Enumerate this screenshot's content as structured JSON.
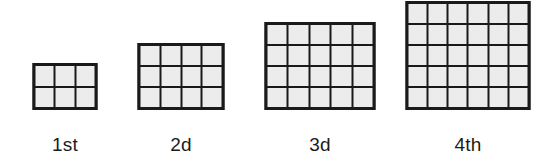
{
  "page": {
    "background_color": "#ffffff",
    "cell_fill_color": "#ececec",
    "line_color": "#1a1a1a",
    "label_color": "#1b1b1b"
  },
  "chart_data": {
    "type": "table",
    "title": "",
    "subtitle": "",
    "xlabel": "",
    "ylabel": "",
    "categories": [
      "1st",
      "2d",
      "3d",
      "4th"
    ],
    "values": [
      6,
      12,
      20,
      30
    ],
    "series": [
      {
        "name": "columns",
        "values": [
          3,
          4,
          5,
          6
        ]
      },
      {
        "name": "rows",
        "values": [
          2,
          3,
          4,
          5
        ]
      },
      {
        "name": "cells",
        "values": [
          6,
          12,
          20,
          30
        ]
      }
    ],
    "legend_position": "none",
    "grid": true
  },
  "figures": [
    {
      "label": "1st",
      "columns": 3,
      "rows": 2,
      "cells": 6,
      "width_px": 65,
      "height_px": 47,
      "center_x_px": 65
    },
    {
      "label": "2d",
      "columns": 4,
      "rows": 3,
      "cells": 12,
      "width_px": 87,
      "height_px": 67,
      "center_x_px": 181
    },
    {
      "label": "3d",
      "columns": 5,
      "rows": 4,
      "cells": 20,
      "width_px": 111,
      "height_px": 88,
      "center_x_px": 320
    },
    {
      "label": "4th",
      "columns": 6,
      "rows": 5,
      "cells": 30,
      "width_px": 125,
      "height_px": 109,
      "center_x_px": 468
    }
  ]
}
